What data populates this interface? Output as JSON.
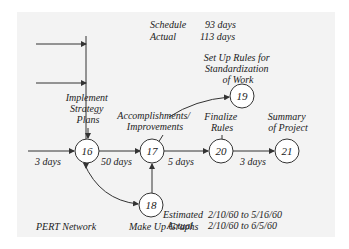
{
  "diagram": {
    "title": "PERT Network",
    "schedule": {
      "label": "Schedule",
      "value": "93 days"
    },
    "actual": {
      "label": "Actual",
      "value": "113 days"
    },
    "dates": {
      "estimated_label": "Estimated",
      "estimated_value": "2/10/60 to 5/16/60",
      "actual_label": "Actual",
      "actual_value": "2/10/60 to 6/5/60"
    },
    "nodes": [
      {
        "id": "16",
        "label_lines": [
          "Implement",
          "Strategy",
          "Plans"
        ]
      },
      {
        "id": "17",
        "label_lines": [
          "Accomplishments/",
          "Improvements"
        ]
      },
      {
        "id": "18",
        "label_lines": [
          "Make Up Graphs"
        ]
      },
      {
        "id": "19",
        "label_lines": [
          "Set Up Rules for",
          "Standardization",
          "of Work"
        ]
      },
      {
        "id": "20",
        "label_lines": [
          "Finalize",
          "Rules"
        ]
      },
      {
        "id": "21",
        "label_lines": [
          "Summary",
          "of Project"
        ]
      }
    ],
    "edges": [
      {
        "from": "start",
        "to": "16",
        "label": "3 days"
      },
      {
        "from": "16",
        "to": "17",
        "label": "50 days"
      },
      {
        "from": "17",
        "to": "20",
        "label": "5 days"
      },
      {
        "from": "20",
        "to": "21",
        "label": "3 days"
      },
      {
        "from": "16",
        "to": "18",
        "label": ""
      },
      {
        "from": "18",
        "to": "17",
        "label": ""
      },
      {
        "from": "17",
        "to": "19",
        "label": ""
      }
    ]
  }
}
